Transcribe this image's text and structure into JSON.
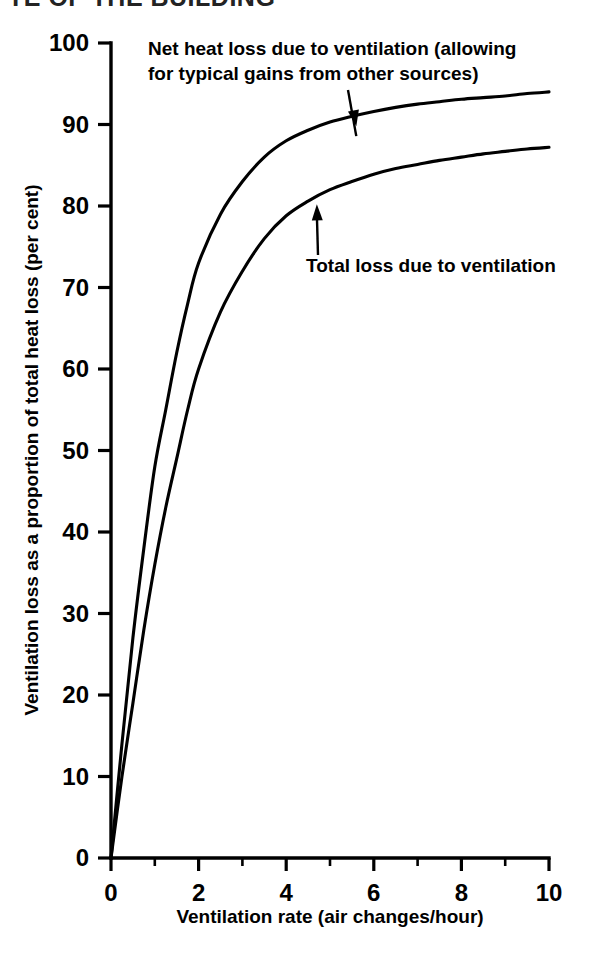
{
  "page": {
    "running_head_partial": "TE OF THE BUILDING",
    "background_color": "#ffffff",
    "ink_color": "#000000"
  },
  "chart_data": {
    "type": "line",
    "title": "",
    "subtitle": "",
    "xlabel": "Ventilation rate (air changes/hour)",
    "ylabel": "Ventilation loss as a proportion of total heat loss (per cent)",
    "xlim": [
      0,
      10
    ],
    "ylim": [
      0,
      100
    ],
    "grid": false,
    "legend_position": "none",
    "x_ticks_major": [
      0,
      2,
      4,
      6,
      8,
      10
    ],
    "x_ticks_major_labels": [
      "0",
      "2",
      "4",
      "6",
      "8",
      "10"
    ],
    "x_ticks_minor": [
      1,
      3,
      5,
      7,
      9
    ],
    "y_ticks_major": [
      0,
      10,
      20,
      30,
      40,
      50,
      60,
      70,
      80,
      90,
      100
    ],
    "y_ticks_major_labels": [
      "0",
      "10",
      "20",
      "30",
      "40",
      "50",
      "60",
      "70",
      "80",
      "90",
      "100"
    ],
    "x": [
      0,
      0.25,
      0.5,
      0.75,
      1,
      1.25,
      1.5,
      1.75,
      2,
      2.5,
      3,
      3.5,
      4,
      4.5,
      5,
      5.5,
      6,
      6.5,
      7,
      7.5,
      8,
      8.5,
      9,
      9.5,
      10
    ],
    "series": [
      {
        "name": "Net heat loss due to ventilation (allowing for typical gains from other sources)",
        "values": [
          0,
          14,
          27,
          38,
          48,
          55,
          62,
          68,
          73,
          79,
          83,
          86,
          88,
          89.3,
          90.3,
          91,
          91.6,
          92.1,
          92.5,
          92.8,
          93.1,
          93.3,
          93.5,
          93.8,
          94
        ],
        "color": "#000000"
      },
      {
        "name": "Total loss due to ventilation",
        "values": [
          0,
          10,
          19,
          28,
          36,
          43,
          49,
          55,
          60,
          67,
          72,
          76,
          78.8,
          80.6,
          82,
          83,
          83.9,
          84.6,
          85.1,
          85.6,
          86,
          86.4,
          86.7,
          87,
          87.2
        ],
        "color": "#000000"
      }
    ],
    "annotations": [
      {
        "id": "net-heat-loss-annotation",
        "lines": [
          "Net heat loss due to ventilation (allowing",
          "for typical gains from other sources)"
        ],
        "points_to": {
          "x": 5.6,
          "y": 89.8
        }
      },
      {
        "id": "total-loss-annotation",
        "lines": [
          "Total loss due to ventilation"
        ],
        "points_to": {
          "x": 4.7,
          "y": 80.2
        }
      }
    ]
  }
}
